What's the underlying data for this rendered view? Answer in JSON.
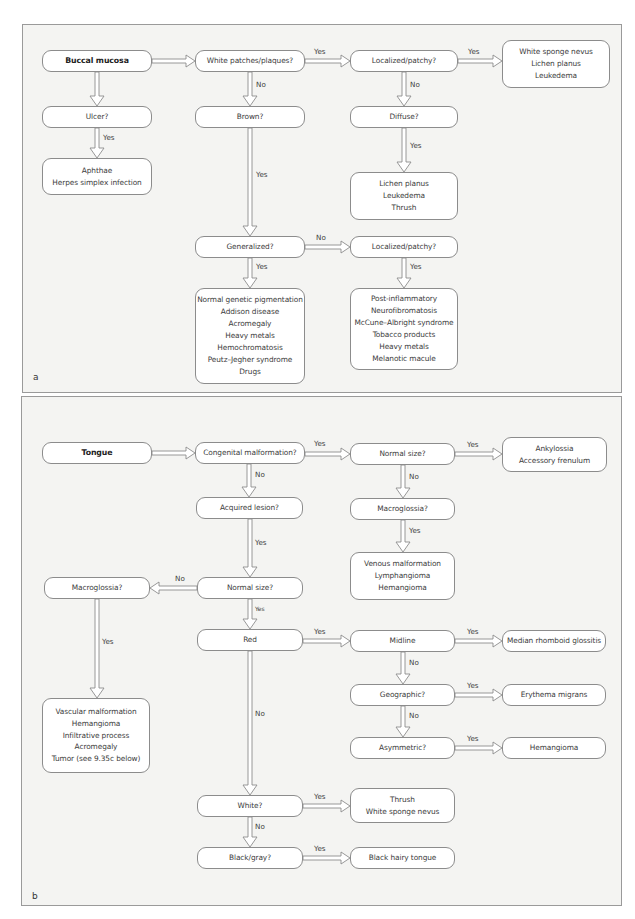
{
  "panel_a": {
    "letter": "a",
    "nodes": {
      "buccal_mucosa": "Buccal mucosa",
      "white_patches": "White patches/plaques?",
      "localized_top": "Localized/patchy?",
      "result_white_sponge": [
        "White sponge nevus",
        "Lichen planus",
        "Leukedema"
      ],
      "ulcer": "Ulcer?",
      "brown": "Brown?",
      "diffuse": "Diffuse?",
      "result_aphthae": [
        "Aphthae",
        "Herpes simplex infection"
      ],
      "result_lichen": [
        "Lichen planus",
        "Leukedema",
        "Thrush"
      ],
      "generalized": "Generalized?",
      "localized_mid": "Localized/patchy?",
      "result_generalized": [
        "Normal genetic pigmentation",
        "Addison disease",
        "Acromegaly",
        "Heavy metals",
        "Hemochromatosis",
        "Peutz–Jegher syndrome",
        "Drugs"
      ],
      "result_localized": [
        "Post-inflammatory",
        "Neurofibromatosis",
        "McCune–Albright syndrome",
        "Tobacco products",
        "Heavy metals",
        "Melanotic macule"
      ]
    },
    "labels": {
      "white_to_localized": "Yes",
      "localized_to_result": "Yes",
      "white_to_brown": "No",
      "localized_to_diffuse": "No",
      "ulcer_to_aphthae": "Yes",
      "brown_to_generalized": "Yes",
      "diffuse_to_result": "Yes",
      "generalized_to_localized": "No",
      "generalized_to_result": "Yes",
      "localized_mid_to_result": "Yes"
    }
  },
  "panel_b": {
    "letter": "b",
    "nodes": {
      "tongue": "Tongue",
      "congenital": "Congenital malformation?",
      "normal_size_top": "Normal size?",
      "result_ankylossia": [
        "Ankylossia",
        "Accessory frenulum"
      ],
      "acquired": "Acquired lesion?",
      "macroglossia_right": "Macroglossia?",
      "result_venous": [
        "Venous malformation",
        "Lymphangioma",
        "Hemangioma"
      ],
      "macroglossia_left": "Macroglossia?",
      "normal_size_mid": "Normal size?",
      "red": "Red",
      "midline": "Midline",
      "result_median": "Median rhomboid glossitis",
      "geographic": "Geographic?",
      "result_erythema": "Erythema migrans",
      "result_vascular": [
        "Vascular malformation",
        "Hemangioma",
        "Infiltrative process",
        "Acromegaly",
        "Tumor (see 9.35c below)"
      ],
      "asymmetric": "Asymmetric?",
      "result_hemangioma": "Hemangioma",
      "white": "White?",
      "result_thrush": [
        "Thrush",
        "White sponge nevus"
      ],
      "black_gray": "Black/gray?",
      "result_black_hairy": "Black hairy tongue"
    },
    "labels": {
      "congenital_to_normal": "Yes",
      "normal_to_ankylossia": "Yes",
      "congenital_to_acquired": "No",
      "normal_to_macro": "No",
      "acquired_to_normal": "Yes",
      "macro_to_venous": "Yes",
      "normal_to_macro_left": "No",
      "macro_left_to_vascular": "Yes",
      "normal_to_red": "Yes",
      "red_to_midline": "Yes",
      "midline_to_median": "Yes",
      "midline_to_geographic": "No",
      "red_to_white": "No",
      "geographic_to_erythema": "Yes",
      "geographic_to_asymmetric": "No",
      "asymmetric_to_hemangioma": "Yes",
      "white_to_thrush": "Yes",
      "white_to_black": "No",
      "black_to_hairy": "Yes"
    }
  }
}
